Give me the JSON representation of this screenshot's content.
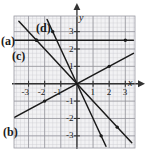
{
  "figure": {
    "title": "",
    "labels": {
      "a": "(a)",
      "b": "(b)",
      "c": "(c)",
      "d": "(d)"
    }
  },
  "chart_data": {
    "type": "line",
    "title": "",
    "xlabel": "x",
    "ylabel": "y",
    "grid": true,
    "grid_minor_step": 0.25,
    "grid_major_step": 1,
    "xlim": [
      -3.9,
      3.6
    ],
    "ylim": [
      -3.7,
      3.9
    ],
    "xticks": [
      -3,
      -2,
      -1,
      1,
      2,
      3
    ],
    "yticks": [
      -3,
      -2,
      -1,
      1,
      2,
      3
    ],
    "xtick_labels": [
      "-3",
      "-2",
      "-1",
      "1",
      "2",
      "3"
    ],
    "ytick_labels": [
      "-3",
      "-2",
      "-1",
      "1",
      "2",
      "3"
    ],
    "series": [
      {
        "name": "(a)",
        "label": "(a)",
        "kind": "line",
        "slope": -1,
        "intercept": 0,
        "x": [
          -3.6,
          3.4
        ],
        "y": [
          3.6,
          -3.4
        ],
        "points": [
          [
            -2.5,
            2.5
          ],
          [
            2.5,
            -2.5
          ]
        ],
        "color": "#1a1a1a"
      },
      {
        "name": "(b)",
        "label": "(b)",
        "kind": "line",
        "slope": 0.5,
        "intercept": 0,
        "x": [
          -3.9,
          3.5
        ],
        "y": [
          -1.95,
          1.75
        ],
        "points": [
          [
            -2,
            -1
          ],
          [
            2,
            1
          ]
        ],
        "color": "#1a1a1a"
      },
      {
        "name": "(c)",
        "label": "(c)",
        "kind": "line",
        "slope": 0,
        "intercept": 2.5,
        "x": [
          -3.9,
          3.5
        ],
        "y": [
          2.5,
          2.5
        ],
        "points": [
          [
            -2.5,
            2.5
          ],
          [
            3,
            2.5
          ]
        ],
        "color": "#1a1a1a"
      },
      {
        "name": "(d)",
        "label": "(d)",
        "kind": "line",
        "slope": -2,
        "intercept": 0,
        "x": [
          -1.85,
          1.8
        ],
        "y": [
          3.7,
          -3.6
        ],
        "points": [
          [
            -1.5,
            3
          ],
          [
            1.5,
            -3
          ]
        ],
        "color": "#1a1a1a"
      }
    ],
    "axis_arrows": [
      "x-positive",
      "y-positive"
    ],
    "colors": {
      "line": "#1a1a1a",
      "axis": "#333333",
      "grid_major": "#8c8c93",
      "grid_minor": "#c9c9d0",
      "background": "#f2f2f4",
      "page": "#ffffff"
    }
  }
}
